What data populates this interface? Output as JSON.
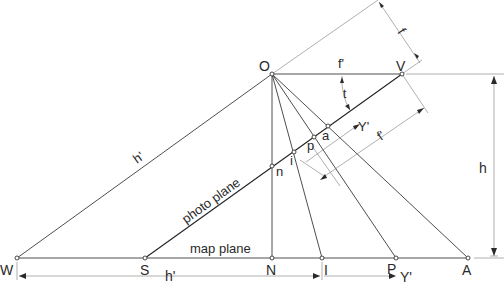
{
  "diagram": {
    "type": "photogrammetry-tilted-photo-geometry",
    "points": {
      "O": {
        "label": "O"
      },
      "V": {
        "label": "V"
      },
      "W": {
        "label": "W"
      },
      "S": {
        "label": "S"
      },
      "N": {
        "label": "N"
      },
      "I": {
        "label": "I"
      },
      "P": {
        "label": "P"
      },
      "A": {
        "label": "A"
      },
      "n": {
        "label": "n"
      },
      "i": {
        "label": "i"
      },
      "p": {
        "label": "p"
      },
      "a": {
        "label": "a"
      }
    },
    "labels": {
      "photo_plane": "photo plane",
      "map_plane": "map plane",
      "h_prime_slant": "h'",
      "h_prime_bottom": "h'",
      "h_vertical": "h",
      "f_top": "f",
      "f_prime_angle": "f'",
      "t_angle": "t",
      "y_prime_photo": "Y'",
      "f_prime_photo": "f'",
      "y_prime_bottom": "Y'"
    }
  }
}
